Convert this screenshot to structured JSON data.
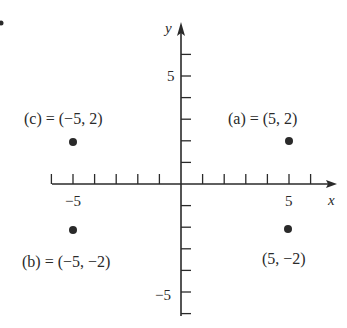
{
  "diagram": {
    "type": "coordinate-plane",
    "origin_px": [
      181,
      184
    ],
    "unit_px": 21.6,
    "axes": {
      "x_label": "x",
      "y_label": "y",
      "x_range": [
        -6,
        7
      ],
      "y_range": [
        -6,
        7
      ],
      "x_tick_labels": [
        {
          "value": -5,
          "text": "−5"
        },
        {
          "value": 5,
          "text": "5"
        }
      ],
      "y_tick_labels": [
        {
          "value": 5,
          "text": "5"
        },
        {
          "value": -5,
          "text": "−5"
        }
      ]
    },
    "points": [
      {
        "id": "a",
        "x": 5,
        "y": 2,
        "label": "(a) = (5, 2)"
      },
      {
        "id": "c",
        "x": -5,
        "y": 2,
        "label": "(c) = (−5, 2)"
      },
      {
        "id": "b",
        "x": -5,
        "y": -2,
        "label": "(b) = (−5, −2)"
      },
      {
        "id": "d",
        "x": 5,
        "y": -2,
        "label": "(5, −2)"
      }
    ],
    "stray_marker": {
      "label": "•"
    },
    "colors": {
      "ink": "#2a2a2a",
      "background": "#ffffff"
    }
  }
}
